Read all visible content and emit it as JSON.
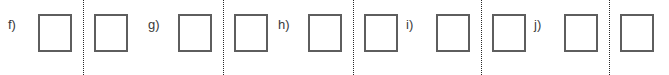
{
  "worksheet": {
    "width": 669,
    "height": 75,
    "background_color": "#ffffff",
    "box_border_color": "#5e5e5e",
    "fold_line_color": "#2a2a2a",
    "label_color": "#3a3a3a",
    "groups": [
      {
        "label": "f)",
        "left_box_text": "",
        "right_box_text": "",
        "fold_line": "vertical-dotted"
      },
      {
        "label": "g)",
        "left_box_text": "",
        "right_box_text": "",
        "fold_line": "vertical-dotted"
      },
      {
        "label": "h)",
        "left_box_text": "",
        "right_box_text": "",
        "fold_line": "vertical-dotted"
      },
      {
        "label": "i)",
        "left_box_text": "",
        "right_box_text": "",
        "fold_line": "vertical-dotted"
      },
      {
        "label": "j)",
        "left_box_text": "",
        "right_box_text": "",
        "fold_line": "vertical-dotted"
      }
    ]
  }
}
